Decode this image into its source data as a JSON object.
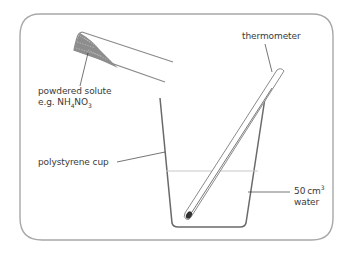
{
  "diagram": {
    "type": "apparatus",
    "labels": {
      "thermometer": "thermometer",
      "solute_line1": "powdered solute",
      "solute_line2_prefix": "e.g. NH",
      "solute_sub1": "4",
      "solute_mid": "NO",
      "solute_sub2": "3",
      "cup": "polystyrene cup",
      "water_volume": "50",
      "water_unit": "cm",
      "water_sup": "3",
      "water_word": "water"
    },
    "colors": {
      "frame": "#9a9a9a",
      "outline": "#6e6e6e",
      "water_line": "#c8c8c8",
      "powder": "#8a8a8a",
      "text": "#3a3a3a"
    }
  }
}
